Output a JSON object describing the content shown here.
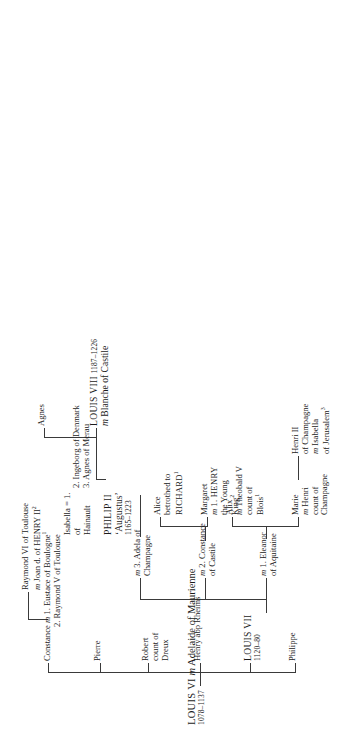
{
  "chart": {
    "type": "genealogy-tree"
  },
  "root": {
    "line1_name": "LOUIS VI",
    "line1_m": "m",
    "line1_spouse": "Adelaide of Maurienne",
    "line2_dates": "1078–1137"
  },
  "gen2": {
    "philippe": "Philippe",
    "louis7_name": "LOUIS VII",
    "louis7_dates": "1120–80",
    "henry": "Henry abp Rheims",
    "robert_l1": "Robert",
    "robert_l2": "count of",
    "robert_l3": "Dreux",
    "pierre": "Pierre",
    "constance_name": "Constance",
    "constance_m": "m",
    "constance_sp1": "1. Eustace of Boulogne",
    "constance_sp1_sup": "1",
    "constance_sp2": "2. Raymond V of Toulouse"
  },
  "raymond6": {
    "line1": "Raymond VI of Toulouse",
    "line2_m": "m",
    "line2": "Joan d. of HENRY II",
    "line2_sup": "2"
  },
  "louis7_marriages": {
    "m1_l1_it": "m",
    "m1_l1": "1. Eleanor",
    "m1_l2": "of Aquitaine",
    "m2_l1_it": "m",
    "m2_l1": "2. Constance",
    "m2_l2": "of Castile",
    "m3_l1_it": "m",
    "m3_l1": "3. Adela of",
    "m3_l2": "Champagne"
  },
  "m1_children": {
    "marie_l1": "Marie",
    "marie_l2_it": "m",
    "marie_l2": "Henri",
    "marie_l3": "count of",
    "marie_l4": "Champagne",
    "alix_l1": "Alix",
    "alix_l2_it": "m",
    "alix_l2": "Theobald V",
    "alix_l3": "count of",
    "alix_l4": "Blois",
    "alix_l4_sup": "1"
  },
  "henri2": {
    "l1": "Henri II",
    "l2": "of Champagne",
    "l3_it": "m",
    "l3": "Isabella",
    "l4": "of Jerusalem",
    "l4_sup": "3"
  },
  "m2_children": {
    "margaret_l1": "Margaret",
    "margaret_l2_it": "m",
    "margaret_l2": "1. HENRY",
    "margaret_l3": "the Young",
    "margaret_l4": "King",
    "margaret_l4_sup": "2",
    "alice_l1": "Alice",
    "alice_l2": "betrothed to",
    "alice_l3": "RICHARD",
    "alice_l3_sup": "1"
  },
  "philip2": {
    "name": "PHILIP II",
    "epithet": "‘Augustus’",
    "dates": "1165–1223",
    "eq": "=",
    "w1_num": "1.",
    "w1_l1": "Isabella",
    "w1_l2": "of",
    "w1_l3": "Hainault",
    "w2": "2. Ingeborg of Denmark",
    "w3": "3. Agnes of Merau"
  },
  "philip2_children": {
    "louis8_name": "LOUIS VIII",
    "louis8_dates": "1187–1226",
    "louis8_m_it": "m",
    "louis8_m": "Blanche of Castile",
    "agnes": "Agnes"
  }
}
